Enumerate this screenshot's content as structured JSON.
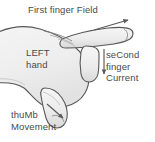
{
  "diagram": {
    "background_color": "#ffffff",
    "ink_color": "#4a4a4a",
    "hand_fill_color": "#f0f0f0",
    "hand_outline_color": "#585858",
    "labels": {
      "field": "First finger Field",
      "hand": "LEFT\nhand",
      "current": "seCond\nfinger\nCurrent",
      "movement": "thuMb\nMovement"
    },
    "arrows": [
      {
        "name": "field-arrow",
        "direction": "up-right",
        "associated_label": "First finger Field"
      },
      {
        "name": "current-arrow",
        "direction": "down",
        "associated_label": "seCond finger Current"
      },
      {
        "name": "movement-arrow",
        "direction": "down-right",
        "associated_label": "thuMb Movement"
      }
    ],
    "parts": [
      {
        "name": "index-finger",
        "orientation": "horizontal-right"
      },
      {
        "name": "middle-finger",
        "orientation": "vertical-down"
      },
      {
        "name": "thumb",
        "orientation": "down-left"
      },
      {
        "name": "palm",
        "orientation": "left"
      }
    ]
  }
}
